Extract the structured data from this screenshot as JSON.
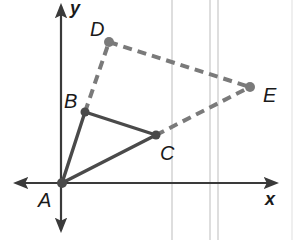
{
  "diagram": {
    "type": "coordinate-geometry",
    "colors": {
      "solid": "#4a4a4a",
      "dashed": "#7a7a7a",
      "axis": "#3a3a3a",
      "background_lines": "#c8c8c8"
    },
    "axes": {
      "x_label": "x",
      "y_label": "y"
    },
    "points": [
      {
        "id": "A",
        "label": "A",
        "px": 62,
        "py": 183
      },
      {
        "id": "B",
        "label": "B",
        "px": 85,
        "py": 112
      },
      {
        "id": "C",
        "label": "C",
        "px": 156,
        "py": 135
      },
      {
        "id": "D",
        "label": "D",
        "px": 109,
        "py": 42
      },
      {
        "id": "E",
        "label": "E",
        "px": 250,
        "py": 87
      }
    ],
    "segments": [
      {
        "from": "A",
        "to": "B",
        "style": "solid"
      },
      {
        "from": "B",
        "to": "C",
        "style": "solid"
      },
      {
        "from": "A",
        "to": "C",
        "style": "solid"
      },
      {
        "from": "B",
        "to": "D",
        "style": "dashed"
      },
      {
        "from": "D",
        "to": "E",
        "style": "dashed"
      },
      {
        "from": "C",
        "to": "E",
        "style": "dashed"
      }
    ]
  }
}
